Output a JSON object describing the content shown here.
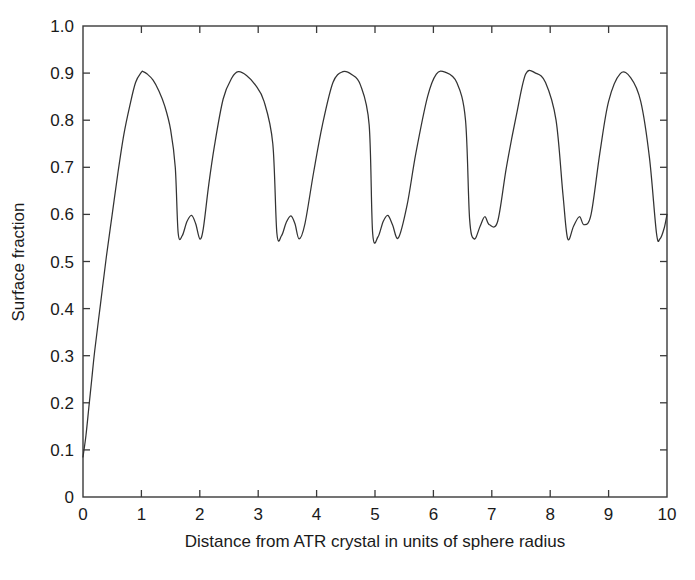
{
  "chart_data": {
    "type": "line",
    "title": "",
    "xlabel": "Distance from ATR crystal in units of sphere radius",
    "ylabel": "Surface fraction",
    "xlim": [
      0,
      10
    ],
    "ylim": [
      0,
      1.0
    ],
    "grid": false,
    "legend": null,
    "x_ticks": [
      0,
      1,
      2,
      3,
      4,
      5,
      6,
      7,
      8,
      9,
      10
    ],
    "x_tick_labels": [
      "0",
      "1",
      "2",
      "3",
      "4",
      "5",
      "6",
      "7",
      "8",
      "9",
      "10"
    ],
    "y_ticks": [
      0,
      0.1,
      0.2,
      0.3,
      0.4,
      0.5,
      0.6,
      0.7,
      0.8,
      0.9,
      1.0
    ],
    "y_tick_labels": [
      "0",
      "0.1",
      "0.2",
      "0.3",
      "0.4",
      "0.5",
      "0.6",
      "0.7",
      "0.8",
      "0.9",
      "1.0"
    ],
    "line_color": "#333333",
    "series": [
      {
        "name": "Surface fraction",
        "x": [
          0.0,
          0.05,
          0.1,
          0.15,
          0.2,
          0.3,
          0.4,
          0.5,
          0.6,
          0.7,
          0.8,
          0.9,
          1.0,
          1.03,
          1.1,
          1.2,
          1.3,
          1.4,
          1.5,
          1.58,
          1.63,
          1.7,
          1.78,
          1.86,
          1.93,
          2.0,
          2.06,
          2.15,
          2.25,
          2.4,
          2.55,
          2.66,
          2.8,
          2.95,
          3.1,
          3.25,
          3.32,
          3.4,
          3.48,
          3.56,
          3.63,
          3.7,
          3.8,
          3.95,
          4.1,
          4.28,
          4.45,
          4.6,
          4.75,
          4.9,
          4.96,
          5.05,
          5.14,
          5.22,
          5.3,
          5.4,
          5.55,
          5.7,
          5.9,
          6.05,
          6.2,
          6.4,
          6.55,
          6.62,
          6.7,
          6.8,
          6.88,
          6.96,
          7.1,
          7.25,
          7.42,
          7.58,
          7.75,
          7.92,
          8.1,
          8.22,
          8.3,
          8.4,
          8.5,
          8.58,
          8.7,
          8.85,
          9.0,
          9.2,
          9.38,
          9.55,
          9.7,
          9.82,
          9.88,
          9.95,
          10.0
        ],
        "y": [
          0.085,
          0.13,
          0.19,
          0.25,
          0.31,
          0.41,
          0.51,
          0.6,
          0.69,
          0.77,
          0.83,
          0.88,
          0.902,
          0.903,
          0.898,
          0.885,
          0.862,
          0.83,
          0.78,
          0.7,
          0.56,
          0.555,
          0.585,
          0.598,
          0.58,
          0.548,
          0.57,
          0.66,
          0.745,
          0.845,
          0.89,
          0.903,
          0.895,
          0.875,
          0.84,
          0.75,
          0.56,
          0.555,
          0.583,
          0.597,
          0.58,
          0.548,
          0.58,
          0.69,
          0.79,
          0.88,
          0.903,
          0.897,
          0.875,
          0.79,
          0.56,
          0.552,
          0.585,
          0.598,
          0.578,
          0.55,
          0.62,
          0.73,
          0.85,
          0.898,
          0.902,
          0.88,
          0.8,
          0.59,
          0.548,
          0.575,
          0.595,
          0.578,
          0.585,
          0.7,
          0.81,
          0.898,
          0.9,
          0.88,
          0.8,
          0.64,
          0.548,
          0.575,
          0.595,
          0.578,
          0.6,
          0.73,
          0.84,
          0.899,
          0.89,
          0.84,
          0.72,
          0.56,
          0.548,
          0.57,
          0.6
        ]
      }
    ],
    "annotations": []
  },
  "figure": {
    "background_color": "#ffffff",
    "frame_color": "#3a3a3a",
    "text_color": "#1a1a1a"
  }
}
